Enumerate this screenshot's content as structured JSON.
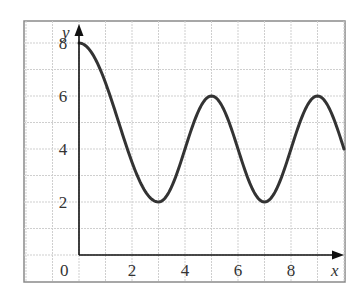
{
  "chart_data": {
    "type": "line",
    "title": "",
    "xlabel": "x",
    "ylabel": "y",
    "xlim": [
      -2,
      10
    ],
    "ylim": [
      -1,
      9
    ],
    "grid": true,
    "x_ticks": [
      "0",
      "2",
      "4",
      "6",
      "8"
    ],
    "y_ticks": [
      "2",
      "4",
      "6",
      "8"
    ],
    "origin_label": "0",
    "series": [
      {
        "name": "curve",
        "x": [
          0,
          0.5,
          1,
          1.5,
          2,
          2.5,
          3,
          3.5,
          4,
          4.5,
          5,
          5.5,
          6,
          6.5,
          7,
          7.5,
          8,
          8.5,
          9,
          9.5,
          10
        ],
        "values": [
          8,
          7.6,
          6.6,
          5.2,
          3.5,
          2.4,
          2,
          2.6,
          4,
          5.4,
          6,
          5.4,
          4,
          2.6,
          2,
          2.6,
          4,
          5.4,
          6,
          5.4,
          4
        ]
      }
    ],
    "key_points": {
      "start_max": [
        0,
        8
      ],
      "minima": [
        [
          3,
          2
        ],
        [
          7,
          2
        ]
      ],
      "maxima": [
        [
          5,
          6
        ],
        [
          9,
          6
        ]
      ]
    },
    "colors": {
      "curve": "#333333",
      "grid": "#cccccc",
      "frame": "#888888",
      "axes": "#111111"
    }
  }
}
